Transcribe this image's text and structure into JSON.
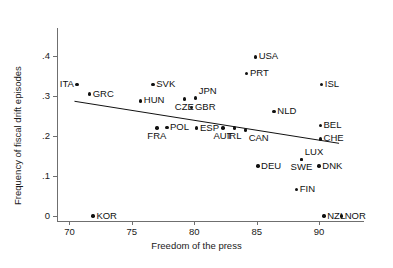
{
  "chart_data": {
    "type": "scatter",
    "title": "",
    "xlabel": "Freedom of the press",
    "ylabel": "Frequency of fiscal drift episodes",
    "xlim": [
      69.0,
      93.6
    ],
    "ylim": [
      -0.012,
      0.47
    ],
    "xticks": [
      70,
      75,
      80,
      85,
      90
    ],
    "xtick_labels": [
      "70",
      "75",
      "80",
      "85",
      "90"
    ],
    "yticks": [
      0,
      0.1,
      0.2,
      0.3,
      0.4
    ],
    "ytick_labels": [
      "0",
      ".1",
      ".2",
      ".3",
      ".4"
    ],
    "grid": false,
    "legend": null,
    "points": [
      {
        "label": "ITA",
        "x": 70.6,
        "y": 0.329,
        "lx": -1,
        "ly": 0
      },
      {
        "label": "GRC",
        "x": 71.6,
        "y": 0.305,
        "lx": 1,
        "ly": 0
      },
      {
        "label": "KOR",
        "x": 71.9,
        "y": 0.0,
        "lx": 1,
        "ly": 0
      },
      {
        "label": "HUN",
        "x": 75.7,
        "y": 0.288,
        "lx": 1,
        "ly": 0
      },
      {
        "label": "SVK",
        "x": 76.7,
        "y": 0.329,
        "lx": 1,
        "ly": 0
      },
      {
        "label": "CZE",
        "x": 79.2,
        "y": 0.293,
        "lx": 0,
        "ly": 1
      },
      {
        "label": "JPN",
        "x": 80.1,
        "y": 0.295,
        "lx": 1,
        "ly": -1
      },
      {
        "label": "GBR",
        "x": 79.8,
        "y": 0.271,
        "lx": 1,
        "ly": 0
      },
      {
        "label": "FRA",
        "x": 77.0,
        "y": 0.22,
        "lx": 0,
        "ly": 1
      },
      {
        "label": "POL",
        "x": 77.8,
        "y": 0.222,
        "lx": 1,
        "ly": 0
      },
      {
        "label": "ESP",
        "x": 80.2,
        "y": 0.22,
        "lx": 1,
        "ly": 0
      },
      {
        "label": "AUT",
        "x": 82.3,
        "y": 0.22,
        "lx": 0,
        "ly": 1
      },
      {
        "label": "IRL",
        "x": 83.2,
        "y": 0.22,
        "lx": 0,
        "ly": 1
      },
      {
        "label": "CAN",
        "x": 84.1,
        "y": 0.215,
        "lx": 1,
        "ly": 1
      },
      {
        "label": "USA",
        "x": 84.9,
        "y": 0.398,
        "lx": 1,
        "ly": 0
      },
      {
        "label": "PRT",
        "x": 84.2,
        "y": 0.357,
        "lx": 1,
        "ly": 0
      },
      {
        "label": "NLD",
        "x": 86.4,
        "y": 0.261,
        "lx": 1,
        "ly": 0
      },
      {
        "label": "DEU",
        "x": 85.1,
        "y": 0.125,
        "lx": 1,
        "ly": 0
      },
      {
        "label": "ISL",
        "x": 90.2,
        "y": 0.329,
        "lx": 1,
        "ly": 0
      },
      {
        "label": "BEL",
        "x": 90.1,
        "y": 0.227,
        "lx": 1,
        "ly": 0
      },
      {
        "label": "CHE",
        "x": 90.1,
        "y": 0.193,
        "lx": 1,
        "ly": 0
      },
      {
        "label": "LUX",
        "x": 88.6,
        "y": 0.142,
        "lx": 1,
        "ly": -1
      },
      {
        "label": "SWE",
        "x": 88.6,
        "y": 0.142,
        "lx": 0,
        "ly": 1
      },
      {
        "label": "DNK",
        "x": 90.0,
        "y": 0.125,
        "lx": 1,
        "ly": 0
      },
      {
        "label": "FIN",
        "x": 88.2,
        "y": 0.066,
        "lx": 1,
        "ly": 0
      },
      {
        "label": "NZL",
        "x": 90.4,
        "y": 0.0,
        "lx": 1,
        "ly": 0
      },
      {
        "label": "NOR",
        "x": 91.8,
        "y": 0.0,
        "lx": 1,
        "ly": 0
      }
    ],
    "fit_line": {
      "x0": 70.4,
      "y0": 0.287,
      "x1": 91.6,
      "y1": 0.182
    }
  },
  "colors": {
    "point": "#111111",
    "axis": "#6f6f6f",
    "text": "#1a1a1a",
    "fit": "#111111",
    "background": "#ffffff"
  }
}
